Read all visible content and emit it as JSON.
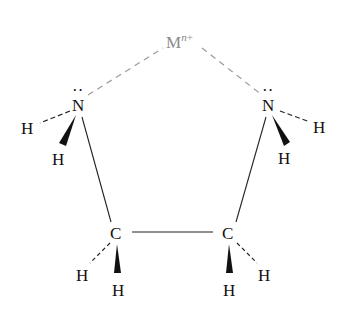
{
  "diagram": {
    "metal": {
      "symbol": "M",
      "charge_var": "n",
      "charge_sign": "+",
      "color": "#8a8a8a"
    },
    "atoms": {
      "n_left": "N",
      "n_right": "N",
      "c_left": "C",
      "c_right": "C",
      "h_n_left_dash": "H",
      "h_n_left_wedge": "H",
      "h_n_right_dash": "H",
      "h_n_right_wedge": "H",
      "h_c_left_dash": "H",
      "h_c_left_wedge": "H",
      "h_c_right_dash": "H",
      "h_c_right_wedge": "H"
    },
    "lone_pair": "··",
    "colors": {
      "bond": "#222222",
      "coordinate_bond": "#9a9a9a"
    }
  }
}
